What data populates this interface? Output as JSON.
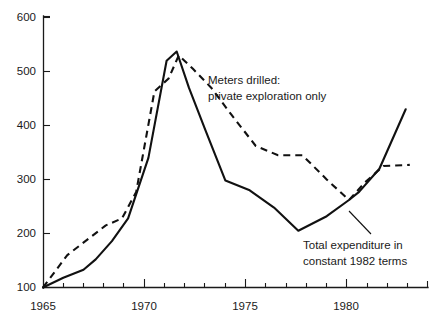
{
  "figure": {
    "background_color": "#ffffff",
    "ink_color": "#111111"
  },
  "axes": {
    "y_ticks": [
      "100",
      "200",
      "300",
      "400",
      "500",
      "600"
    ],
    "x_major_ticks": [
      "1965",
      "1970",
      "1975",
      "1980"
    ],
    "x_minor_tick_years": [
      1966,
      1967,
      1968,
      1969,
      1971,
      1972,
      1973,
      1974,
      1976,
      1977,
      1978,
      1979,
      1981,
      1982,
      1983
    ],
    "x_axis_start_year": 1965,
    "x_axis_end_year": 1984
  },
  "annotations": [
    {
      "name": "meters-drilled-annotation",
      "line1": "Meters drilled:",
      "line2": "private exploration only",
      "x": 208,
      "y": 84,
      "leader": null
    },
    {
      "name": "total-expenditure-annotation",
      "line1": "Total expenditure in",
      "line2": "constant 1982 terms",
      "x": 303,
      "y": 248,
      "leader": [
        [
          349,
          211
        ],
        [
          371,
          234
        ]
      ]
    }
  ],
  "chart_data": {
    "type": "line",
    "title": "",
    "xlabel": "",
    "ylabel": "",
    "xlim": [
      1965,
      1984
    ],
    "ylim": [
      100,
      600
    ],
    "grid": false,
    "legend": "inline-annotations",
    "series": [
      {
        "name": "Total expenditure in constant 1982 terms",
        "style": "solid",
        "x": [
          1965.0,
          1966.0,
          1967.0,
          1967.6,
          1968.4,
          1969.2,
          1970.2,
          1971.1,
          1971.6,
          1972.2,
          1973.0,
          1974.0,
          1975.2,
          1976.4,
          1977.6,
          1979.0,
          1980.1,
          1980.6,
          1981.6,
          1982.9
        ],
        "y": [
          100,
          118,
          133,
          152,
          186,
          228,
          340,
          520,
          537,
          470,
          393,
          298,
          280,
          248,
          205,
          232,
          262,
          277,
          320,
          430
        ]
      },
      {
        "name": "Meters drilled: private exploration only",
        "style": "dashed",
        "x": [
          1965.0,
          1966.2,
          1968.1,
          1968.9,
          1969.6,
          1970.5,
          1971.2,
          1971.7,
          1972.4,
          1973.3,
          1974.3,
          1975.5,
          1976.6,
          1977.8,
          1979.0,
          1980.1,
          1980.9,
          1981.8,
          1983.1
        ],
        "y": [
          100,
          160,
          215,
          228,
          277,
          463,
          487,
          530,
          505,
          470,
          420,
          362,
          345,
          345,
          300,
          262,
          295,
          325,
          327
        ]
      }
    ],
    "series_rendered_pixels": {
      "note": "polyline point lists in figure pixel space, 432x327",
      "solid": "43,287 63,278 84,270 97,260 113,243 130,222 151,167 169,57 179,48 190,80 206,117 226,165 250,174 274,190 298,212 326,199 348,185 359,178 380,157 406,15",
      "dashed": "43,287 67,255 104,228 120,222 134,196 152,95 166,82 176,59 190,72 208,95 228,122 253,153 276,161 300,162 324,185 348,212 364,198 382,179 408,29"
    }
  }
}
